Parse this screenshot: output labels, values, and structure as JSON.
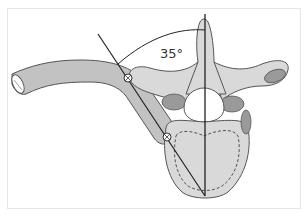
{
  "figure": {
    "angle_label": "35°",
    "colors": {
      "bone_light": "#d9d9d9",
      "bone_mid": "#bdbdbd",
      "bone_dark": "#8f8f8f",
      "outline": "#555555",
      "line": "#222222",
      "frame_border": "#e6e6e6"
    },
    "elements": [
      "rib",
      "vertebra",
      "spinous-process",
      "transverse-process-left",
      "transverse-process-right",
      "vertebral-body",
      "screw-trajectory-line",
      "midline-reference",
      "angle-arc",
      "screw-head-upper",
      "screw-head-lower"
    ]
  }
}
